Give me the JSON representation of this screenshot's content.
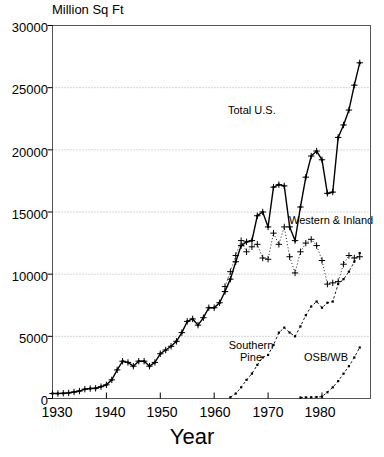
{
  "chart_data": {
    "type": "line",
    "title": "",
    "ylabel": "Million Sq Ft",
    "xlabel": "Year",
    "xlim": [
      1930,
      1989
    ],
    "ylim": [
      0,
      30000
    ],
    "ytick_values": [
      0,
      5000,
      10000,
      15000,
      20000,
      25000,
      30000
    ],
    "ytick_labels": [
      "0",
      "5000",
      "10000",
      "15000",
      "20000",
      "25000",
      "30000"
    ],
    "xtick_values": [
      1930,
      1940,
      1950,
      1960,
      1970,
      1980
    ],
    "xtick_labels": [
      "1930",
      "1940",
      "1950",
      "1960",
      "1970",
      "1980"
    ],
    "grid": "horizontal-dotted",
    "legend": "inline-annotations",
    "series": [
      {
        "name": "Total U.S.",
        "label": "Total U.S.",
        "label_lines": [
          "Total U.S."
        ],
        "marker": "plus-and-dot",
        "line": "solid",
        "color": "#000000",
        "x": [
          1930,
          1931,
          1932,
          1933,
          1934,
          1935,
          1936,
          1937,
          1938,
          1939,
          1940,
          1941,
          1942,
          1943,
          1944,
          1945,
          1946,
          1947,
          1948,
          1949,
          1950,
          1951,
          1952,
          1953,
          1954,
          1955,
          1956,
          1957,
          1958,
          1959,
          1960,
          1961,
          1962,
          1963,
          1964,
          1965,
          1966,
          1967,
          1968,
          1969,
          1970,
          1971,
          1972,
          1973,
          1974,
          1975,
          1976,
          1977,
          1978,
          1979,
          1980,
          1981,
          1982,
          1983,
          1984,
          1985,
          1986,
          1987
        ],
        "values": [
          400,
          400,
          420,
          450,
          520,
          600,
          750,
          800,
          820,
          950,
          1100,
          1500,
          2300,
          3000,
          2900,
          2600,
          3000,
          3000,
          2600,
          2900,
          3600,
          3900,
          4200,
          4600,
          5300,
          6200,
          6400,
          5900,
          6500,
          7300,
          7300,
          7700,
          8600,
          9600,
          11000,
          12300,
          12600,
          12700,
          14700,
          15000,
          13800,
          17000,
          17200,
          17100,
          13800,
          12700,
          15400,
          17800,
          19500,
          19900,
          19200,
          16500,
          16600,
          21000,
          22000,
          23200,
          25200,
          27000
        ]
      },
      {
        "name": "Western & Inland",
        "label": "Western & Inland",
        "label_lines": [
          "Western & Inland"
        ],
        "marker": "plus",
        "line": "dotted",
        "color": "#000000",
        "x": [
          1962,
          1963,
          1964,
          1965,
          1966,
          1967,
          1968,
          1969,
          1970,
          1971,
          1972,
          1973,
          1974,
          1975,
          1976,
          1977,
          1978,
          1979,
          1980,
          1981,
          1982,
          1983,
          1984,
          1985,
          1986,
          1987
        ],
        "values": [
          9000,
          10200,
          11500,
          12700,
          11800,
          12200,
          12400,
          11300,
          11200,
          13300,
          12400,
          13800,
          11400,
          10100,
          11800,
          12500,
          12800,
          12300,
          11100,
          9200,
          9300,
          9400,
          10800,
          11500,
          11300,
          11400
        ]
      },
      {
        "name": "Southern Pine",
        "label": "Southern Pine",
        "label_lines": [
          "Southern",
          "Pine"
        ],
        "marker": "dot",
        "line": "dashed",
        "color": "#000000",
        "x": [
          1963,
          1964,
          1965,
          1966,
          1967,
          1968,
          1969,
          1970,
          1971,
          1972,
          1973,
          1974,
          1975,
          1976,
          1977,
          1978,
          1979,
          1980,
          1981,
          1982,
          1983,
          1984,
          1985,
          1986,
          1987
        ],
        "values": [
          100,
          400,
          900,
          1500,
          2000,
          2700,
          3300,
          3500,
          4300,
          5300,
          5700,
          5300,
          5000,
          5800,
          6700,
          7400,
          7800,
          7300,
          7700,
          7800,
          9200,
          9600,
          10200,
          11000,
          11700
        ]
      },
      {
        "name": "OSB/WB",
        "label": "OSB/WB",
        "label_lines": [
          "OSB/WB"
        ],
        "marker": "dot",
        "line": "dashed",
        "color": "#000000",
        "x": [
          1976,
          1977,
          1978,
          1979,
          1980,
          1981,
          1982,
          1983,
          1984,
          1985,
          1986,
          1987
        ],
        "values": [
          80,
          90,
          100,
          120,
          150,
          500,
          900,
          1400,
          2000,
          2600,
          3300,
          4100
        ]
      }
    ]
  },
  "axes": {
    "ylabel": "Million Sq Ft",
    "xlabel": "Year",
    "yticks": [
      "30000",
      "25000",
      "20000",
      "15000",
      "10000",
      "5000",
      "0"
    ],
    "xticks": [
      "1930",
      "1940",
      "1950",
      "1960",
      "1970",
      "1980"
    ]
  },
  "annotations": {
    "total_us": "Total U.S.",
    "western_inland": "Western & Inland",
    "southern_pine_line1": "Southern",
    "southern_pine_line2": "Pine",
    "osb_wb": "OSB/WB"
  },
  "colors": {
    "ink": "#000000",
    "background": "#ffffff",
    "grid": "#999999",
    "axis": "#555555"
  }
}
